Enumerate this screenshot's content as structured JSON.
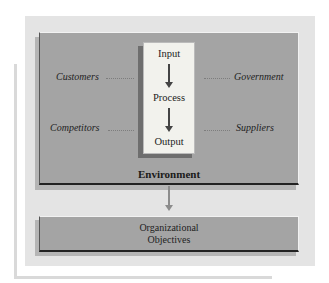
{
  "diagram": {
    "process_box": {
      "steps": [
        "Input",
        "Process",
        "Output"
      ]
    },
    "external_factors": {
      "left": [
        "Customers",
        "Competitors"
      ],
      "right": [
        "Government",
        "Suppliers"
      ]
    },
    "environment_label": "Environment",
    "objectives": {
      "line1": "Organizational",
      "line2": "Objectives"
    }
  },
  "colors": {
    "panel_background": "#e4e4e4",
    "box_fill": "#a4a4a4",
    "process_fill": "#f2f2ed",
    "arrow": "#444444"
  }
}
